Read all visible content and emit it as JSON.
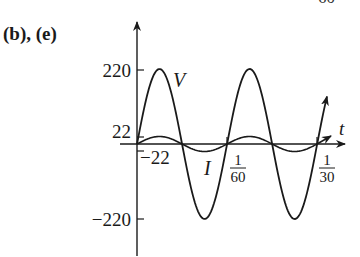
{
  "header": {
    "panel_label": "(b), (e)",
    "cut_off_text": "60"
  },
  "chart_data": {
    "type": "line",
    "title": "",
    "xlabel": "t",
    "ylabel": "",
    "x_ticks": [
      {
        "value": 0,
        "num": "",
        "den": ""
      },
      {
        "value": 0.016667,
        "num": "1",
        "den": "60"
      },
      {
        "value": 0.033333,
        "num": "1",
        "den": "30"
      }
    ],
    "y_ticks": [
      "220",
      "22",
      "−22",
      "−220"
    ],
    "y_tick_values": [
      220,
      22,
      -22,
      -220
    ],
    "xlim": [
      0,
      0.0333
    ],
    "ylim": [
      -220,
      220
    ],
    "frequency_hz": 60,
    "series": [
      {
        "name": "V",
        "label": "V",
        "amplitude": 220,
        "function": "220 sin(120πt)",
        "x": [
          0,
          0.004167,
          0.008333,
          0.0125,
          0.016667,
          0.020833,
          0.025,
          0.029167,
          0.033333
        ],
        "values": [
          0,
          220,
          0,
          -220,
          0,
          220,
          0,
          -220,
          0
        ]
      },
      {
        "name": "I",
        "label": "I",
        "amplitude": 22,
        "function": "22 sin(120πt)",
        "x": [
          0,
          0.004167,
          0.008333,
          0.0125,
          0.016667,
          0.020833,
          0.025,
          0.029167,
          0.033333
        ],
        "values": [
          0,
          22,
          0,
          -22,
          0,
          22,
          0,
          -22,
          0
        ]
      }
    ],
    "grid": false,
    "legend": "inline labels"
  },
  "labels": {
    "t_axis": "t",
    "v_curve": "V",
    "i_curve": "I",
    "y220": "220",
    "y22": "22",
    "yneg22": "−22",
    "yneg220": "−220",
    "x1_num": "1",
    "x1_den": "60",
    "x2_num": "1",
    "x2_den": "30"
  }
}
